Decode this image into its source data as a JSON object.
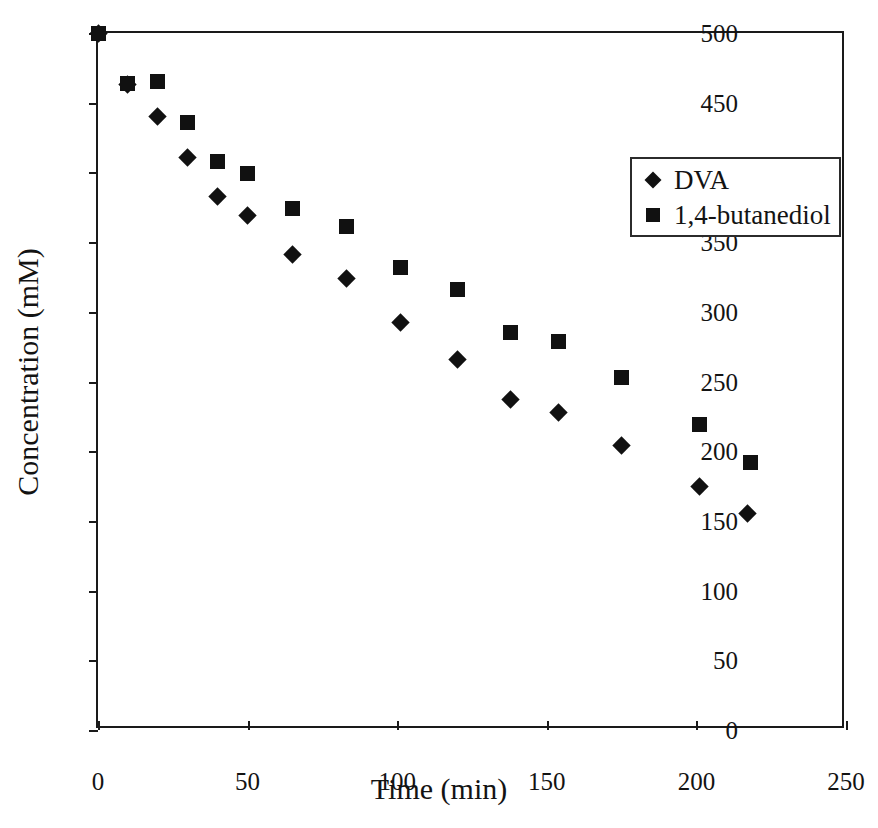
{
  "chart_data": {
    "type": "scatter",
    "title": "",
    "xlabel": "Time (min)",
    "ylabel": "Concentration (mM)",
    "xlim": [
      0,
      250
    ],
    "ylim": [
      0,
      500
    ],
    "xticks": [
      0,
      50,
      100,
      150,
      200,
      250
    ],
    "yticks": [
      0,
      50,
      100,
      150,
      200,
      250,
      300,
      350,
      400,
      450,
      500
    ],
    "grid": false,
    "legend_position": "upper-right-inside",
    "series": [
      {
        "name": "DVA",
        "marker": "diamond",
        "color": "#111111",
        "points": [
          {
            "x": 0,
            "y": 500
          },
          {
            "x": 10,
            "y": 463
          },
          {
            "x": 20,
            "y": 440
          },
          {
            "x": 30,
            "y": 411
          },
          {
            "x": 40,
            "y": 383
          },
          {
            "x": 50,
            "y": 369
          },
          {
            "x": 65,
            "y": 341
          },
          {
            "x": 83,
            "y": 324
          },
          {
            "x": 101,
            "y": 292
          },
          {
            "x": 120,
            "y": 266
          },
          {
            "x": 138,
            "y": 237
          },
          {
            "x": 154,
            "y": 228
          },
          {
            "x": 175,
            "y": 204
          },
          {
            "x": 201,
            "y": 175
          },
          {
            "x": 217,
            "y": 155
          }
        ]
      },
      {
        "name": "1,4-butanediol",
        "marker": "square",
        "color": "#111111",
        "points": [
          {
            "x": 0,
            "y": 500
          },
          {
            "x": 10,
            "y": 464
          },
          {
            "x": 20,
            "y": 465
          },
          {
            "x": 30,
            "y": 436
          },
          {
            "x": 40,
            "y": 408
          },
          {
            "x": 50,
            "y": 399
          },
          {
            "x": 65,
            "y": 374
          },
          {
            "x": 83,
            "y": 361
          },
          {
            "x": 101,
            "y": 332
          },
          {
            "x": 120,
            "y": 316
          },
          {
            "x": 138,
            "y": 285
          },
          {
            "x": 154,
            "y": 279
          },
          {
            "x": 175,
            "y": 253
          },
          {
            "x": 201,
            "y": 219
          },
          {
            "x": 218,
            "y": 192
          }
        ]
      }
    ]
  },
  "legend": {
    "entries": [
      {
        "label": "DVA",
        "marker": "diamond"
      },
      {
        "label": "1,4-butanediol",
        "marker": "square"
      }
    ]
  }
}
